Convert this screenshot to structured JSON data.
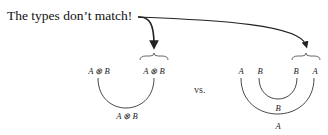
{
  "caption": "The types don’t match!",
  "separator": "vs.",
  "left_diagram": {
    "top_left": "A ⊗ B",
    "top_right": "A ⊗ B",
    "bottom": "A ⊗ B"
  },
  "right_diagram": {
    "top": [
      "A",
      "B",
      "B",
      "A"
    ],
    "inner_arc": "B",
    "outer_arc": "A"
  },
  "colors": {
    "ink": "#222222",
    "background": "#ffffff"
  }
}
